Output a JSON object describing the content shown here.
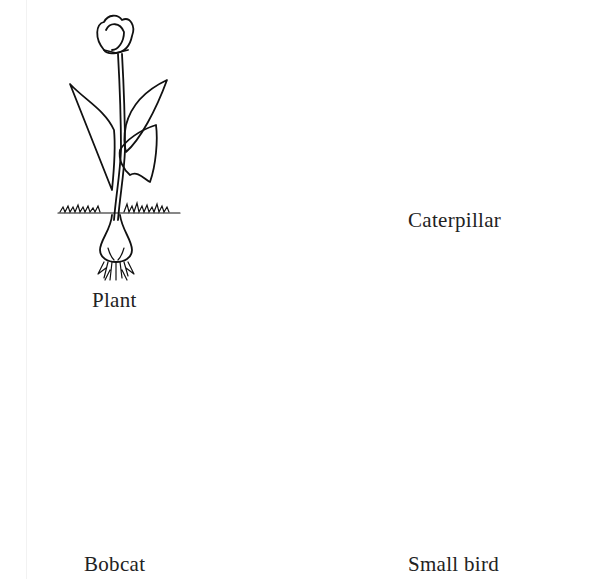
{
  "diagram": {
    "type": "food-web",
    "organisms": [
      {
        "id": "plant",
        "label": "Plant",
        "icon": "tulip-plant-icon"
      },
      {
        "id": "caterpillar",
        "label": "Caterpillar",
        "icon": "caterpillar-icon"
      },
      {
        "id": "bobcat",
        "label": "Bobcat",
        "icon": "bobcat-icon"
      },
      {
        "id": "small_bird",
        "label": "Small bird",
        "icon": "bird-icon"
      }
    ],
    "arrows": [
      {
        "from": "caterpillar",
        "to": "plant",
        "color": "#999999"
      }
    ],
    "colors": {
      "line": "#111111",
      "arrow": "#999999",
      "text": "#222222",
      "background": "#ffffff"
    }
  }
}
